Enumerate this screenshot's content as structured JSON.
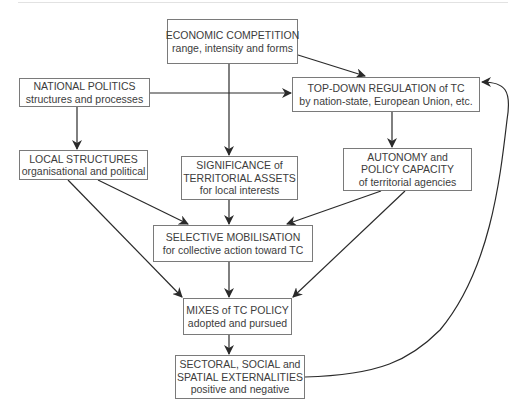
{
  "diagram": {
    "nodes": [
      {
        "id": "economic",
        "lines": [
          "ECONOMIC COMPETITION",
          "range, intensity and forms"
        ]
      },
      {
        "id": "national",
        "lines": [
          "NATIONAL POLITICS",
          "structures and processes"
        ]
      },
      {
        "id": "topdown",
        "lines": [
          "TOP-DOWN REGULATION of TC",
          "by nation-state, European Union, etc."
        ]
      },
      {
        "id": "local",
        "lines": [
          "LOCAL STRUCTURES",
          "organisational and political"
        ]
      },
      {
        "id": "significance",
        "lines": [
          "SIGNIFICANCE of",
          "TERRITORIAL ASSETS",
          "for local interests"
        ]
      },
      {
        "id": "autonomy",
        "lines": [
          "AUTONOMY and",
          "POLICY CAPACITY",
          "of territorial agencies"
        ]
      },
      {
        "id": "selective",
        "lines": [
          "SELECTIVE MOBILISATION",
          "for collective action toward TC"
        ]
      },
      {
        "id": "mixes",
        "lines": [
          "MIXES of TC POLICY",
          "adopted and pursued"
        ]
      },
      {
        "id": "sectoral",
        "lines": [
          "SECTORAL, SOCIAL and",
          "SPATIAL EXTERNALITIES",
          "positive and negative"
        ]
      }
    ],
    "edges": [
      {
        "from": "economic",
        "to": "topdown"
      },
      {
        "from": "economic",
        "to": "significance"
      },
      {
        "from": "national",
        "to": "topdown"
      },
      {
        "from": "national",
        "to": "local"
      },
      {
        "from": "topdown",
        "to": "autonomy"
      },
      {
        "from": "local",
        "to": "selective"
      },
      {
        "from": "local",
        "to": "mixes"
      },
      {
        "from": "significance",
        "to": "selective"
      },
      {
        "from": "autonomy",
        "to": "selective"
      },
      {
        "from": "autonomy",
        "to": "mixes"
      },
      {
        "from": "selective",
        "to": "mixes"
      },
      {
        "from": "mixes",
        "to": "sectoral"
      },
      {
        "from": "sectoral",
        "to": "topdown",
        "style": "curved-feedback"
      }
    ],
    "colors": {
      "line": "#2a2a2a",
      "box_border": "#7a7a7a",
      "text": "#3c3c3c"
    }
  }
}
